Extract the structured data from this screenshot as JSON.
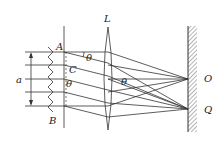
{
  "diagram": {
    "labels": {
      "lens": "L",
      "grating_top": "A",
      "grating_bottom": "B",
      "slit_point": "C",
      "width": "a",
      "angle_top": "θ",
      "angle_mid": "θ",
      "angle_lens": "θ",
      "focus_center": "O",
      "focus_off": "Q"
    }
  }
}
